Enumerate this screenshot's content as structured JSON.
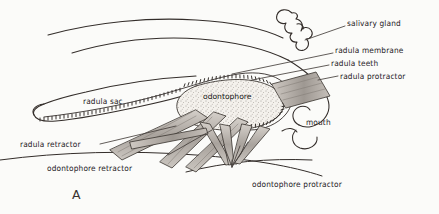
{
  "figure": {
    "letter": "A"
  },
  "labels": {
    "salivary_gland": "salivary gland",
    "radula_membrane": "radula membrane",
    "radula_teeth": "radula teeth",
    "radula_protractor": "radula protractor",
    "mouth": "mouth",
    "radula_sac": "radula sac",
    "odontophore": "odontophore",
    "radula_retractor": "radula retractor",
    "odontophore_retractor": "odontophore retractor",
    "odontophore_protractor": "odontophore protractor"
  },
  "colors": {
    "background": "#fbfbf9",
    "ink": "#26211f",
    "line": "#332d2a",
    "muscle_fill": "#b9b4ae",
    "odontophore_fill": "#f2efe9",
    "teeth": "#2a2522"
  },
  "structures": [
    {
      "name": "salivary-gland",
      "description": "lobed wiggly gland outline, upper right"
    },
    {
      "name": "radula-sac",
      "description": "elongated tapering sac extending to the left"
    },
    {
      "name": "radula-membrane",
      "description": "band carrying the teeth over the odontophore"
    },
    {
      "name": "radula-teeth",
      "description": "dense row of small dark teeth along the membrane"
    },
    {
      "name": "odontophore",
      "description": "stippled cartilage mass beneath the radula"
    },
    {
      "name": "mouth",
      "description": "wavy anterior opening at right"
    },
    {
      "name": "radula-protractor",
      "description": "muscle band running to upper right"
    },
    {
      "name": "radula-retractor",
      "description": "muscle band running to lower left"
    },
    {
      "name": "odontophore-retractor",
      "description": "muscle band running to lower left"
    },
    {
      "name": "odontophore-protractor",
      "description": "muscle bands converging below the odontophore"
    }
  ]
}
